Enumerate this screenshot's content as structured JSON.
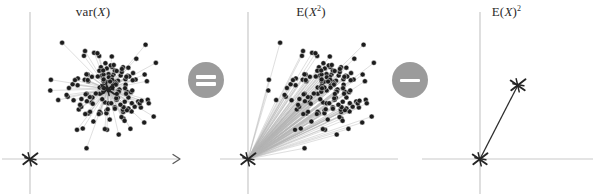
{
  "figure": {
    "caption_identity": "var(X) = E(X^2) - E(X)^2",
    "background_color": "#ffffff",
    "width": 593,
    "height": 196
  },
  "style": {
    "axis_color": "#c9c9c9",
    "dot_color": "#1c1c1c",
    "spoke_color": "#b4b4b4",
    "marker_color": "#242424",
    "badge_color": "#9b9b9b",
    "badge_glyph_color": "#ffffff",
    "title_color": "#2b2b2b",
    "vector_color": "#2e2e2e"
  },
  "panels": [
    {
      "id": "panel-var",
      "name": "variance-panel",
      "title_prefix": "var(",
      "title_var": "X",
      "title_suffix": ")",
      "title_exponent": "",
      "x": 0,
      "width": 186,
      "axes": {
        "origin_x": 30,
        "origin_y": 159,
        "x_axis_from": 2,
        "x_axis_to": 180,
        "y_axis_from": 12,
        "y_axis_to": 194,
        "x_arrow": true
      },
      "center_marker": {
        "x": 108,
        "y": 89,
        "size": 16
      },
      "origin_marker": {
        "x": 30,
        "y": 159,
        "size": 17
      },
      "cloud": {
        "center_x": 108,
        "center_y": 89,
        "spread_x": 29,
        "spread_y": 27,
        "n_points": 150,
        "spokes_from": "center",
        "seed": 7
      }
    },
    {
      "id": "panel-esq",
      "name": "second-moment-panel",
      "title_prefix": "E(",
      "title_var": "X",
      "title_suffix": ")",
      "title_exponent": "2",
      "exponent_inside": true,
      "x": 218,
      "width": 186,
      "axes": {
        "origin_x": 30,
        "origin_y": 159,
        "x_axis_from": 2,
        "x_axis_to": 180,
        "y_axis_from": 12,
        "y_axis_to": 194,
        "x_arrow": false
      },
      "center_marker": null,
      "origin_marker": {
        "x": 30,
        "y": 159,
        "size": 17
      },
      "cloud": {
        "center_x": 108,
        "center_y": 89,
        "spread_x": 29,
        "spread_y": 27,
        "n_points": 150,
        "spokes_from": "origin",
        "seed": 7
      }
    },
    {
      "id": "panel-esquared",
      "name": "mean-squared-panel",
      "title_prefix": "E(",
      "title_var": "X",
      "title_suffix": ")",
      "title_exponent": "2",
      "exponent_inside": false,
      "x": 420,
      "width": 173,
      "axes": {
        "origin_x": 60,
        "origin_y": 159,
        "x_axis_from": 2,
        "x_axis_to": 173,
        "y_axis_from": 12,
        "y_axis_to": 194,
        "x_arrow": false
      },
      "center_marker": {
        "x": 98,
        "y": 85,
        "size": 17
      },
      "origin_marker": {
        "x": 60,
        "y": 159,
        "size": 17
      },
      "vector": {
        "x1": 60,
        "y1": 159,
        "x2": 98,
        "y2": 85
      },
      "cloud": null
    }
  ],
  "operators": [
    {
      "id": "op-equals",
      "name": "equals-badge",
      "glyph": "equals-icon",
      "symbol": "=",
      "x": 188,
      "y": 62
    },
    {
      "id": "op-minus",
      "name": "minus-badge",
      "glyph": "minus-icon",
      "symbol": "−",
      "x": 392,
      "y": 62
    }
  ],
  "chart_data": {
    "type": "scatter",
    "panels": [
      {
        "label": "var(X)",
        "description": "Scatter cloud with spokes drawn from the cloud centroid to each point; an X marks the centroid and a separate X marks the axis origin.",
        "centroid": [
          108,
          89
        ],
        "origin": [
          30,
          159
        ],
        "n_points": 150,
        "spoke_anchor": "centroid"
      },
      {
        "label": "E(X^2)",
        "description": "Same scatter cloud with spokes drawn from the axis origin to each point; a single X marks the origin.",
        "centroid": [
          108,
          89
        ],
        "origin": [
          30,
          159
        ],
        "n_points": 150,
        "spoke_anchor": "origin"
      },
      {
        "label": "E(X)^2",
        "description": "A single vector from the axis origin X to the centroid X.",
        "centroid": [
          98,
          85
        ],
        "origin": [
          60,
          159
        ],
        "n_points": 0,
        "spoke_anchor": "origin"
      }
    ],
    "xlabel": "",
    "ylabel": "",
    "grid": false,
    "legend": false
  }
}
